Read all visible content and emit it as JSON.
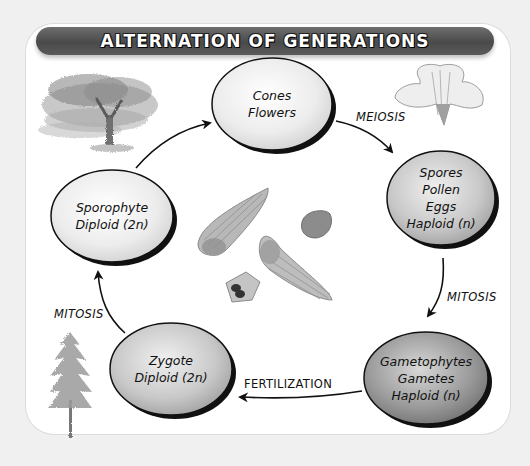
{
  "title": "ALTERNATION OF GENERATIONS",
  "colors": {
    "background": "#f0f0f0",
    "panel": "#ffffff",
    "title_bar": "#555555",
    "title_text": "#ffffff",
    "node_light": "#f2f2f2",
    "node_dark": "#8a8a8a",
    "outline": "#111111"
  },
  "nodes": [
    {
      "id": "cones-flowers",
      "lines": [
        "Cones",
        "Flowers"
      ]
    },
    {
      "id": "spores",
      "lines": [
        "Spores",
        "Pollen",
        "Eggs",
        "Haploid (n)"
      ]
    },
    {
      "id": "gametophytes",
      "lines": [
        "Gametophytes",
        "Gametes",
        "Haploid (n)"
      ]
    },
    {
      "id": "zygote",
      "lines": [
        "Zygote",
        "Diploid (2n)"
      ]
    },
    {
      "id": "sporophyte",
      "lines": [
        "Sporophyte",
        "Diploid (2n)"
      ]
    }
  ],
  "processes": {
    "meiosis": "MEIOSIS",
    "mitosis_right": "MITOSIS",
    "fertilization": "FERTILIZATION",
    "mitosis_left": "MITOSIS"
  },
  "illustrations": [
    "deciduous-tree-illustration",
    "flower-illustration",
    "seeds-illustration",
    "conifer-tree-illustration"
  ]
}
